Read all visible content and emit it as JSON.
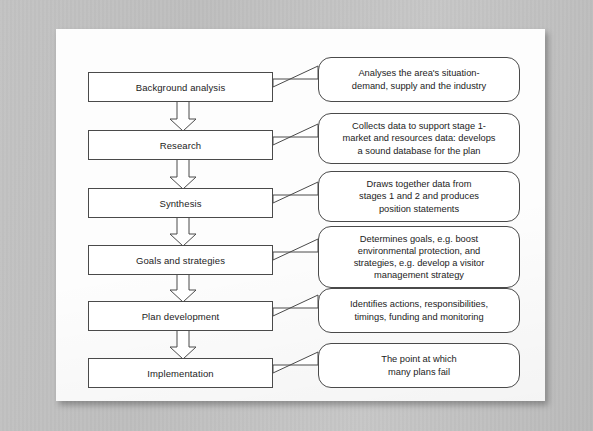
{
  "document": {
    "type": "flow-diagram",
    "title": "Tourism planning process flowchart",
    "page_background": "#fdfdfd",
    "surround_background": "#c0c0c0",
    "line_color": "#4a4a4a",
    "text_color": "#1c1c1c"
  },
  "diagram": {
    "orientation": "vertical",
    "connector_style": "hollow-block-arrow",
    "stages": [
      {
        "id": "stage-1",
        "label": "Background analysis",
        "callout_lines": [
          "Analyses the area's situation-",
          "demand, supply and the industry"
        ]
      },
      {
        "id": "stage-2",
        "label": "Research",
        "callout_lines": [
          "Collects data to support stage 1-",
          "market and resources data: develops",
          "a sound database for the plan"
        ]
      },
      {
        "id": "stage-3",
        "label": "Synthesis",
        "callout_lines": [
          "Draws together data from",
          "stages 1 and 2 and produces",
          "position statements"
        ]
      },
      {
        "id": "stage-4",
        "label": "Goals and strategies",
        "callout_lines": [
          "Determines goals, e.g. boost",
          "environmental protection, and",
          "strategies, e.g. develop a visitor",
          "management strategy"
        ]
      },
      {
        "id": "stage-5",
        "label": "Plan development",
        "callout_lines": [
          "Identifies actions, responsibilities,",
          "timings, funding and monitoring"
        ]
      },
      {
        "id": "stage-6",
        "label": "Implementation",
        "callout_lines": [
          "The point at which",
          "many plans fail"
        ]
      }
    ]
  }
}
